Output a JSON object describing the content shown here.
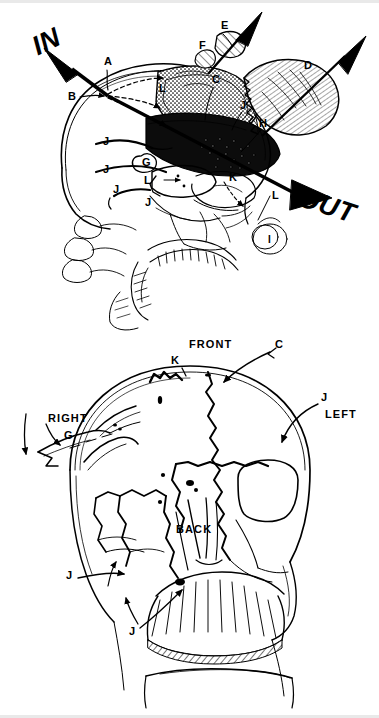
{
  "figure": {
    "ink_color": "#000000",
    "paper_color": "#ffffff"
  },
  "top_view": {
    "name": "lateral-skull-view",
    "trajectory": {
      "entry_label": "IN",
      "exit_label": "OUT"
    },
    "labels": [
      {
        "id": "A",
        "text": "A",
        "x": 104,
        "y": 62
      },
      {
        "id": "B",
        "text": "B",
        "x": 71,
        "y": 97
      },
      {
        "id": "L1",
        "text": "L",
        "x": 159,
        "y": 89
      },
      {
        "id": "C",
        "text": "C",
        "x": 213,
        "y": 81
      },
      {
        "id": "E",
        "text": "E",
        "x": 223,
        "y": 26
      },
      {
        "id": "F",
        "text": "F",
        "x": 201,
        "y": 47
      },
      {
        "id": "D",
        "text": "D",
        "x": 306,
        "y": 67
      },
      {
        "id": "J1",
        "text": "J",
        "x": 241,
        "y": 106
      },
      {
        "id": "H",
        "text": "H",
        "x": 260,
        "y": 125
      },
      {
        "id": "J2",
        "text": "J",
        "x": 104,
        "y": 142
      },
      {
        "id": "J3",
        "text": "J",
        "x": 104,
        "y": 170
      },
      {
        "id": "G",
        "text": "G",
        "x": 147,
        "y": 160
      },
      {
        "id": "L2",
        "text": "L",
        "x": 146,
        "y": 180
      },
      {
        "id": "J4",
        "text": "J",
        "x": 114,
        "y": 190
      },
      {
        "id": "J5",
        "text": "J",
        "x": 146,
        "y": 203
      },
      {
        "id": "K",
        "text": "K",
        "x": 230,
        "y": 178
      },
      {
        "id": "L3",
        "text": "L",
        "x": 273,
        "y": 196
      },
      {
        "id": "I",
        "text": "I",
        "x": 265,
        "y": 234
      }
    ]
  },
  "bottom_view": {
    "name": "frontal-skull-view",
    "orientation_labels": [
      {
        "id": "FRONT",
        "text": "FRONT",
        "x": 189,
        "y": 344
      },
      {
        "id": "RIGHT",
        "text": "RIGHT",
        "x": 48,
        "y": 418
      },
      {
        "id": "LEFT",
        "text": "LEFT",
        "x": 325,
        "y": 414
      },
      {
        "id": "BACK",
        "text": "BACK",
        "x": 176,
        "y": 529
      }
    ],
    "labels": [
      {
        "id": "K",
        "text": "K",
        "x": 174,
        "y": 361
      },
      {
        "id": "C",
        "text": "C",
        "x": 276,
        "y": 345
      },
      {
        "id": "J1",
        "text": "J",
        "x": 322,
        "y": 398
      },
      {
        "id": "G",
        "text": "G",
        "x": 66,
        "y": 436
      },
      {
        "id": "J2",
        "text": "J",
        "x": 68,
        "y": 576
      },
      {
        "id": "J3",
        "text": "J",
        "x": 131,
        "y": 632
      }
    ]
  },
  "legend_keys": [
    "A",
    "B",
    "C",
    "D",
    "E",
    "F",
    "G",
    "H",
    "I",
    "J",
    "K",
    "L"
  ]
}
